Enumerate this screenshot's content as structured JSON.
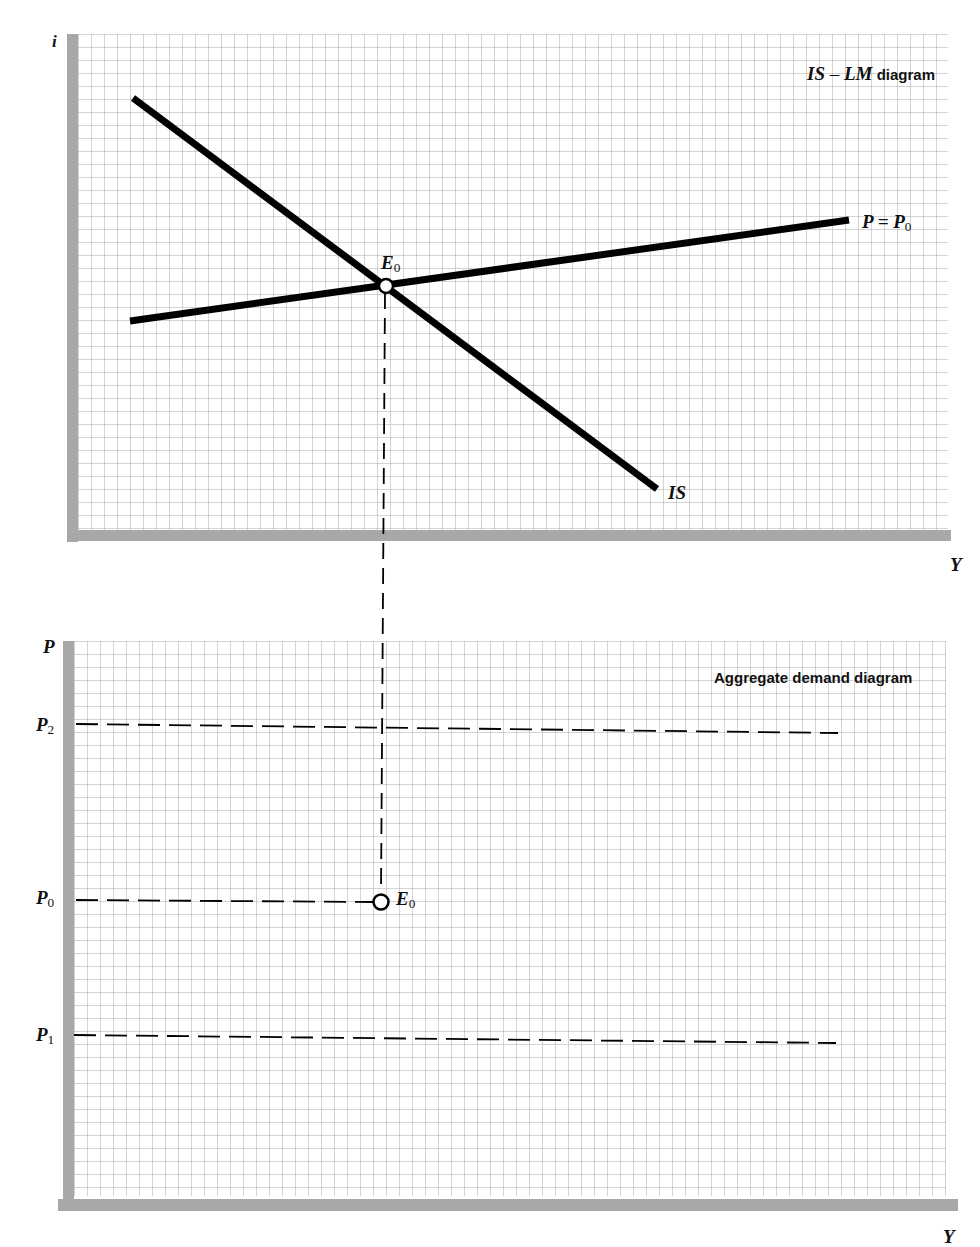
{
  "top_panel": {
    "title_part1": "IS",
    "title_sep": " – ",
    "title_part2": "LM",
    "title_rest": " diagram",
    "y_axis_label": "i",
    "x_axis_label": "Y",
    "curves": {
      "is_label": "IS",
      "lm_label_main": "P = P",
      "lm_label_sub": "0"
    },
    "equilibrium": {
      "main": "E",
      "sub": "0"
    }
  },
  "bottom_panel": {
    "title": "Aggregate demand diagram",
    "y_axis_label": "P",
    "x_axis_label": "Y",
    "price_levels": [
      {
        "main": "P",
        "sub": "2"
      },
      {
        "main": "P",
        "sub": "0"
      },
      {
        "main": "P",
        "sub": "1"
      }
    ],
    "equilibrium": {
      "main": "E",
      "sub": "0"
    }
  },
  "colors": {
    "axis": "#a8a8a8",
    "grid": "#bdbdbd",
    "curve": "#000000"
  }
}
